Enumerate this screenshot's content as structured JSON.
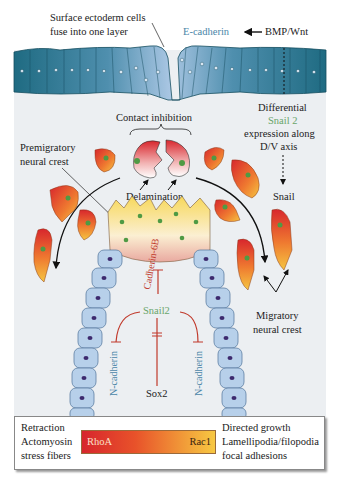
{
  "figure": {
    "labels": {
      "surface_ectoderm": [
        "Surface ectoderm cells",
        "fuse into one layer"
      ],
      "e_cadherin": "E-cadherin",
      "bmp_wnt": "BMP/Wnt",
      "contact_inhibition": "Contact inhibition",
      "differential": [
        "Differential",
        "Snail 2",
        "expression along",
        "D/V axis"
      ],
      "premigratory": [
        "Premigratory",
        "neural crest"
      ],
      "delamination": "Delamination",
      "snail": "Snail",
      "cadherin_6b": "Cadherin-6B",
      "snail2": "Snail2",
      "migratory": [
        "Migratory",
        "neural crest"
      ],
      "n_cadherin_left": "N-cadherin",
      "n_cadherin_right": "N-cadherin",
      "sox2": "Sox2"
    },
    "colors": {
      "ectoderm_dark": "#1f6b82",
      "ectoderm_light": "#a9c6e3",
      "neural_tube": "#b7d0ea",
      "nucleus": "#3d2a6e",
      "crest_red": "#d8262d",
      "crest_yellow": "#f5c542",
      "crest_nucleus": "#4f9a44",
      "inhibition_line": "#c0392b",
      "background": "#eceff2"
    }
  },
  "legend": {
    "left_lines": [
      "Retraction",
      "Actomyosin",
      "stress fibers"
    ],
    "bar_left": "RhoA",
    "bar_right": "Rac1",
    "right_lines": [
      "Directed growth",
      "Lamellipodia/filopodia",
      "focal adhesions"
    ]
  }
}
